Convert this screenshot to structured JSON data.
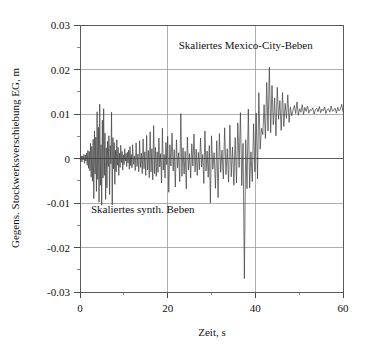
{
  "chart_data": {
    "type": "line",
    "title": "",
    "xlabel": "Zeit, s",
    "ylabel": "Gegens. Stockwerksverschiebung EG, m",
    "xlim": [
      0,
      60
    ],
    "ylim": [
      -0.03,
      0.03
    ],
    "grid": true,
    "legend_position": "none",
    "x_ticks_major": [
      0,
      20,
      40,
      60
    ],
    "x_ticks_major_labels": [
      "0",
      "20",
      "40",
      "60"
    ],
    "x_ticks_minor": [
      10,
      30,
      50
    ],
    "y_ticks_major": [
      0.03,
      0.02,
      0.01,
      0,
      -0.01,
      -0.02,
      -0.03
    ],
    "y_ticks_major_labels": [
      "0.03",
      "0.02",
      "0.01",
      "0",
      "-0.01",
      "-0.02",
      "-0.03"
    ],
    "y_ticks_minor": [
      0.025,
      0.015,
      0.005,
      -0.005,
      -0.015,
      -0.025
    ],
    "annotations": [
      {
        "name": "mexico-city-label",
        "text": "Skaliertes Mexico-City-Beben",
        "x": 22.5,
        "y": 0.0245
      },
      {
        "name": "synthetic-label",
        "text": "Skaliertes synth. Beben",
        "x": 2.5,
        "y": -0.0123
      }
    ],
    "series": [
      {
        "name": "relative-storey-displacement",
        "color": "#3c3c3c",
        "x": [
          0.0,
          0.15,
          0.3,
          0.45,
          0.6,
          0.75,
          0.9,
          1.05,
          1.2,
          1.35,
          1.5,
          1.65,
          1.8,
          1.95,
          2.1,
          2.25,
          2.4,
          2.55,
          2.7,
          2.85,
          3.0,
          3.15,
          3.3,
          3.45,
          3.6,
          3.75,
          3.9,
          4.05,
          4.2,
          4.35,
          4.5,
          4.65,
          4.8,
          4.95,
          5.1,
          5.25,
          5.4,
          5.55,
          5.7,
          5.85,
          6.0,
          6.15,
          6.3,
          6.45,
          6.6,
          6.75,
          6.9,
          7.05,
          7.2,
          7.35,
          7.5,
          7.65,
          7.8,
          7.95,
          8.1,
          8.25,
          8.4,
          8.55,
          8.7,
          8.85,
          9.0,
          9.15,
          9.3,
          9.45,
          9.6,
          9.75,
          9.9,
          10.05,
          10.2,
          10.35,
          10.5,
          10.65,
          10.8,
          10.95,
          11.1,
          11.25,
          11.4,
          11.55,
          11.7,
          11.85,
          12.0,
          12.2,
          12.4,
          12.6,
          12.8,
          13.0,
          13.2,
          13.4,
          13.6,
          13.8,
          14.0,
          14.2,
          14.4,
          14.6,
          14.8,
          15.0,
          15.2,
          15.4,
          15.6,
          15.8,
          16.0,
          16.2,
          16.4,
          16.6,
          16.8,
          17.0,
          17.2,
          17.4,
          17.6,
          17.8,
          18.0,
          18.2,
          18.4,
          18.6,
          18.8,
          19.0,
          19.2,
          19.4,
          19.6,
          19.8,
          20.0,
          20.25,
          20.5,
          20.75,
          21.0,
          21.25,
          21.5,
          21.75,
          22.0,
          22.25,
          22.5,
          22.75,
          23.0,
          23.25,
          23.5,
          23.75,
          24.0,
          24.25,
          24.5,
          24.75,
          25.0,
          25.25,
          25.5,
          25.75,
          26.0,
          26.25,
          26.5,
          26.75,
          27.0,
          27.25,
          27.5,
          27.75,
          28.0,
          28.25,
          28.5,
          28.75,
          29.0,
          29.25,
          29.5,
          29.75,
          30.0,
          30.3,
          30.6,
          30.9,
          31.2,
          31.5,
          31.8,
          32.1,
          32.4,
          32.7,
          33.0,
          33.3,
          33.6,
          33.9,
          34.2,
          34.5,
          34.8,
          35.1,
          35.4,
          35.7,
          36.0,
          36.3,
          36.6,
          36.9,
          37.2,
          37.5,
          37.8,
          38.1,
          38.4,
          38.7,
          39.0,
          39.3,
          39.6,
          39.9,
          40.2,
          40.5,
          40.8,
          41.1,
          41.4,
          41.7,
          42.0,
          42.3,
          42.6,
          42.9,
          43.2,
          43.5,
          43.8,
          44.1,
          44.4,
          44.7,
          45.0,
          45.3,
          45.6,
          45.9,
          46.2,
          46.5,
          46.8,
          47.1,
          47.4,
          47.7,
          48.0,
          48.3,
          48.6,
          48.9,
          49.2,
          49.5,
          49.8,
          50.1,
          50.4,
          50.7,
          51.0,
          51.3,
          51.6,
          51.9,
          52.2,
          52.5,
          52.8,
          53.1,
          53.4,
          53.7,
          54.0,
          54.3,
          54.6,
          54.9,
          55.2,
          55.5,
          55.8,
          56.1,
          56.4,
          56.7,
          57.0,
          57.3,
          57.6,
          57.9,
          58.2,
          58.5,
          58.8,
          59.1,
          59.4,
          59.7,
          60.0
        ],
        "y": [
          0.0,
          -0.0004,
          0.0006,
          -0.0008,
          0.0005,
          -0.0003,
          0.0009,
          -0.0011,
          0.0008,
          -0.0006,
          0.0012,
          -0.0015,
          0.0018,
          -0.0022,
          0.0016,
          -0.0028,
          0.0034,
          -0.0042,
          0.0027,
          -0.0051,
          0.0043,
          -0.009,
          0.0062,
          -0.0035,
          0.0048,
          -0.0074,
          0.0105,
          -0.0047,
          0.007,
          -0.0098,
          0.0122,
          -0.006,
          0.0031,
          -0.0105,
          0.0086,
          -0.0044,
          0.0112,
          -0.0038,
          0.0057,
          -0.0092,
          0.0024,
          -0.0066,
          0.0039,
          -0.0018,
          0.0051,
          -0.0081,
          0.0029,
          -0.0012,
          0.0104,
          -0.0104,
          0.0047,
          -0.0023,
          0.0036,
          -0.0058,
          0.0019,
          -0.003,
          0.0042,
          -0.0015,
          0.0025,
          -0.0038,
          0.0012,
          -0.002,
          0.003,
          -0.0009,
          0.0016,
          -0.0026,
          0.0008,
          -0.0014,
          0.0022,
          -0.0006,
          0.0011,
          -0.0018,
          0.0014,
          -0.001,
          0.0019,
          -0.0024,
          0.0027,
          -0.0016,
          0.0009,
          -0.0021,
          0.0031,
          -0.0013,
          0.0006,
          -0.0027,
          0.0035,
          -0.0018,
          0.001,
          -0.003,
          0.004,
          -0.002,
          0.0012,
          -0.0034,
          0.0044,
          -0.0023,
          0.0015,
          -0.0038,
          0.0052,
          -0.0026,
          0.0018,
          -0.0043,
          0.006,
          -0.003,
          0.0022,
          -0.0048,
          0.0074,
          -0.0034,
          0.0025,
          -0.004,
          0.0015,
          -0.0031,
          0.0046,
          -0.0019,
          0.0011,
          -0.0055,
          0.0068,
          -0.0026,
          0.0009,
          -0.0044,
          0.0036,
          -0.0014,
          0.005,
          -0.0076,
          0.0031,
          -0.0017,
          0.0057,
          -0.0028,
          0.002,
          -0.0064,
          0.0042,
          -0.0021,
          0.0013,
          -0.0052,
          0.0101,
          -0.004,
          0.0024,
          -0.0035,
          0.0016,
          -0.0068,
          0.0048,
          -0.0026,
          0.0011,
          -0.0044,
          0.0033,
          -0.0017,
          0.0055,
          -0.003,
          0.0021,
          -0.0038,
          0.0014,
          -0.0025,
          0.0046,
          -0.0019,
          0.0009,
          -0.0056,
          0.0062,
          -0.0028,
          0.0017,
          -0.0042,
          0.0029,
          -0.01,
          0.0051,
          -0.0024,
          0.0013,
          -0.0067,
          0.004,
          -0.0088,
          0.0056,
          -0.0031,
          0.0019,
          -0.0046,
          0.0069,
          -0.0036,
          0.0022,
          -0.0053,
          0.0075,
          -0.0041,
          0.0026,
          -0.006,
          0.0047,
          -0.0055,
          0.008,
          -0.002,
          0.0103,
          -0.0061,
          0.0034,
          -0.027,
          0.0042,
          -0.0068,
          0.0111,
          -0.0066,
          0.0015,
          -0.0052,
          0.0078,
          -0.003,
          0.0102,
          -0.0046,
          0.0148,
          0.0021,
          0.0068,
          0.0054,
          0.0121,
          0.0045,
          0.0171,
          0.0062,
          0.0205,
          0.0058,
          0.0164,
          0.0076,
          0.0136,
          0.0051,
          0.016,
          0.0088,
          0.013,
          0.0063,
          0.0148,
          0.0072,
          0.0124,
          0.009,
          0.0143,
          0.0081,
          0.0116,
          0.0096,
          0.0108,
          0.0119,
          0.0101,
          0.0127,
          0.0097,
          0.0112,
          0.0104,
          0.0121,
          0.0099,
          0.0115,
          0.0106,
          0.0118,
          0.0102,
          0.011,
          0.0108,
          0.0114,
          0.01,
          0.0109,
          0.0113,
          0.0105,
          0.0117,
          0.0103,
          0.0111,
          0.0107,
          0.0116,
          0.0101,
          0.011,
          0.0112,
          0.0104,
          0.0118,
          0.0106,
          0.0109,
          0.0113,
          0.0102,
          0.0115,
          0.0107,
          0.0111,
          0.0122,
          0.0105
        ]
      }
    ]
  }
}
